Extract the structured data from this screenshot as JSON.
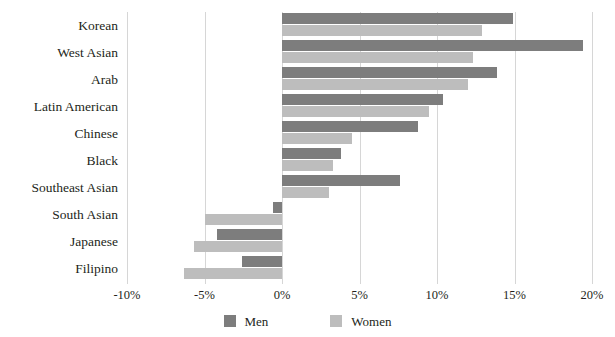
{
  "chart_data": {
    "type": "bar",
    "orientation": "horizontal",
    "title": "",
    "subtitle": "",
    "xlabel": "",
    "ylabel": "",
    "xlim": [
      -10,
      20
    ],
    "ylim": null,
    "grid": true,
    "grid_axis": "x",
    "legend_position": "bottom",
    "categories": [
      "Korean",
      "West Asian",
      "Arab",
      "Latin American",
      "Chinese",
      "Black",
      "Southeast Asian",
      "South Asian",
      "Japanese",
      "Filipino"
    ],
    "series": [
      {
        "name": "Men",
        "color": "#7d7d7d",
        "values": [
          14.9,
          19.4,
          13.9,
          10.4,
          8.8,
          3.8,
          7.6,
          -0.6,
          -4.2,
          -2.6
        ]
      },
      {
        "name": "Women",
        "color": "#bdbdbd",
        "values": [
          12.9,
          12.3,
          12.0,
          9.5,
          4.5,
          3.3,
          3.0,
          -5.0,
          -5.7,
          -6.3
        ]
      }
    ],
    "xticks": [
      {
        "value": -10,
        "label": "-10%"
      },
      {
        "value": -5,
        "label": "-5%"
      },
      {
        "value": 0,
        "label": "0%"
      },
      {
        "value": 5,
        "label": "5%"
      },
      {
        "value": 10,
        "label": "10%"
      },
      {
        "value": 15,
        "label": "15%"
      },
      {
        "value": 20,
        "label": "20%"
      }
    ],
    "gridline_color": "#d6d6d6",
    "background": "#ffffff",
    "text_color": "#231f20"
  },
  "legend": {
    "items": [
      {
        "label": "Men",
        "color": "#7d7d7d",
        "swatch_name": "legend-swatch-men"
      },
      {
        "label": "Women",
        "color": "#bdbdbd",
        "swatch_name": "legend-swatch-women"
      }
    ]
  }
}
